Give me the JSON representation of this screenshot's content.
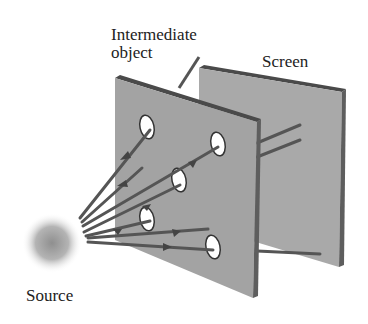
{
  "labels": {
    "intermediate_object": "Intermediate\nobject",
    "screen": "Screen",
    "source": "Source"
  },
  "colors": {
    "background": "#ffffff",
    "panel_face": "#a6a6a6",
    "panel_edge_top": "#5a5a5a",
    "panel_edge_side": "#606060",
    "ray": "#555555",
    "source_glow": "#9a9a9a",
    "hole": "#ffffff",
    "text": "#222222"
  },
  "objects": [
    {
      "name": "source",
      "type": "light-source"
    },
    {
      "name": "intermediate-object",
      "type": "plate-with-holes",
      "hole_count": 5
    },
    {
      "name": "screen",
      "type": "plate"
    }
  ]
}
